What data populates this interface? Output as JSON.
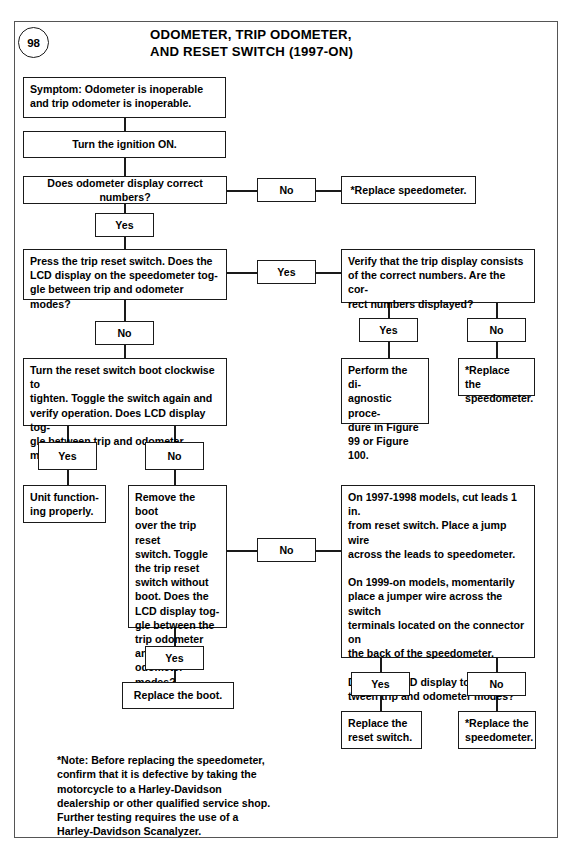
{
  "page": {
    "number": "98",
    "title_line1": "ODOMETER, TRIP ODOMETER,",
    "title_line2": "AND RESET SWITCH (1997-ON)"
  },
  "labels": {
    "yes": "Yes",
    "no": "No"
  },
  "nodes": {
    "symptom": "Symptom: Odometer is inoperable\nand trip odometer is inoperable.",
    "ignition": "Turn the ignition ON.",
    "odo_display_q": "Does odometer display correct numbers?",
    "replace_speedo_1": "*Replace speedometer.",
    "press_trip_reset_q": "Press the trip reset switch. Does the\nLCD display on the speedometer tog-\ngle between trip and odometer modes?",
    "verify_trip_display_q": "Verify that the trip display consists\nof the correct numbers. Are the cor-\nrect numbers displayed?",
    "perform_diagnostic": "Perform the di-\nagnostic proce-\ndure in Figure\n99 or Figure 100.",
    "replace_speedo_2": "*Replace the\nspeedometer.",
    "turn_boot_q": "Turn the reset switch boot clockwise to\ntighten. Toggle the switch again and\nverify operation. Does LCD display tog-\ngle between trip and odometer modes?",
    "unit_functioning": "Unit function-\ning properly.",
    "remove_boot_q": "Remove the boot\nover the trip reset\nswitch. Toggle\nthe trip reset\nswitch without\nboot. Does the\nLCD display tog-\ngle between the\ntrip odometer and\nodometer modes?",
    "jumper_wire_q": "On 1997-1998 models, cut leads 1 in.\nfrom reset switch. Place a jump wire\nacross the leads to speedometer.\n\nOn 1999-on models, momentarily\nplace a jumper wire across the switch\nterminals located on the connector on\nthe back of the speedometer.\n\nDoes the LCD display toggle be-\ntween trip and odometer modes?",
    "replace_boot": "Replace the boot.",
    "replace_reset_switch": "Replace the\nreset switch.",
    "replace_speedo_3": "*Replace the\nspeedometer."
  },
  "footnote": "*Note: Before replacing the speedometer,\nconfirm that it is defective by taking the\nmotorcycle to a Harley-Davidson\ndealership or other qualified service shop.\nFurther testing requires the use of a\nHarley-Davidson Scanalyzer."
}
